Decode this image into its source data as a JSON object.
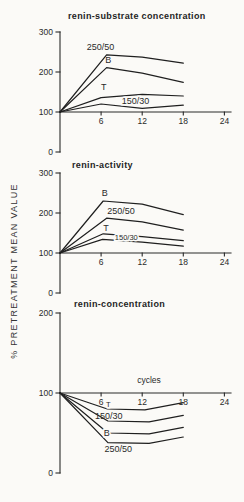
{
  "figure": {
    "ylabel": "% PRETREATMENT MEAN VALUE",
    "background": "#fbfaf7",
    "ink": "#1f1f1f"
  },
  "chart_data": [
    {
      "type": "line",
      "title": "renin-substrate concentration",
      "xlabel": "",
      "xlabel_pos": null,
      "xlim": [
        0,
        25
      ],
      "ylim": [
        0,
        300
      ],
      "xticks": [
        6,
        12,
        18,
        24
      ],
      "yticks": [
        0,
        100,
        200,
        300
      ],
      "baseline": 100,
      "legend_position": "inline-labels",
      "grid": false,
      "series": [
        {
          "name": "250/50",
          "points": [
            [
              0,
              100
            ],
            [
              6.8,
              243
            ],
            [
              12,
              237
            ],
            [
              18,
              222
            ]
          ],
          "label": {
            "text": "250/50",
            "x": 3.9,
            "y": 255,
            "small": false,
            "halo": false
          }
        },
        {
          "name": "B",
          "points": [
            [
              0,
              100
            ],
            [
              6.8,
              211
            ],
            [
              12,
              197
            ],
            [
              18,
              174
            ]
          ],
          "label": {
            "text": "B",
            "x": 6.6,
            "y": 222,
            "small": false,
            "halo": false
          }
        },
        {
          "name": "T",
          "points": [
            [
              0,
              100
            ],
            [
              6,
              136
            ],
            [
              12,
              144
            ],
            [
              18,
              140
            ]
          ],
          "label": {
            "text": "T",
            "x": 6.0,
            "y": 155,
            "small": false,
            "halo": false
          }
        },
        {
          "name": "150/30",
          "points": [
            [
              0,
              100
            ],
            [
              6,
              120
            ],
            [
              12,
              109
            ],
            [
              18,
              117
            ]
          ],
          "label": {
            "text": "150/30",
            "x": 9.0,
            "y": 120,
            "small": false,
            "halo": true
          }
        }
      ]
    },
    {
      "type": "line",
      "title": "renin-activity",
      "xlabel": "",
      "xlabel_pos": null,
      "xlim": [
        0,
        25
      ],
      "ylim": [
        0,
        300
      ],
      "xticks": [
        6,
        12,
        18,
        24
      ],
      "yticks": [
        0,
        100,
        200,
        300
      ],
      "baseline": 100,
      "legend_position": "inline-labels",
      "grid": false,
      "series": [
        {
          "name": "B",
          "points": [
            [
              0,
              100
            ],
            [
              6.3,
              230
            ],
            [
              12,
              222
            ],
            [
              18,
              196
            ]
          ],
          "label": {
            "text": "B",
            "x": 6.1,
            "y": 242,
            "small": false,
            "halo": false
          }
        },
        {
          "name": "250/50",
          "points": [
            [
              0,
              100
            ],
            [
              6.8,
              187
            ],
            [
              12,
              178
            ],
            [
              18,
              157
            ]
          ],
          "label": {
            "text": "250/50",
            "x": 6.9,
            "y": 197,
            "small": false,
            "halo": false
          }
        },
        {
          "name": "T",
          "points": [
            [
              0,
              100
            ],
            [
              6.3,
              148
            ],
            [
              12,
              141
            ],
            [
              18,
              131
            ]
          ],
          "label": {
            "text": "T",
            "x": 6.3,
            "y": 155,
            "small": false,
            "halo": false
          }
        },
        {
          "name": "150/30",
          "points": [
            [
              0,
              100
            ],
            [
              6.2,
              134
            ],
            [
              12,
              127
            ],
            [
              18,
              117
            ]
          ],
          "label": {
            "text": "150/30",
            "x": 8.0,
            "y": 132,
            "small": true,
            "halo": true
          }
        }
      ]
    },
    {
      "type": "line",
      "title": "renin-concentration",
      "xlabel": "cycles",
      "xlabel_pos": {
        "x": 13,
        "y": 112
      },
      "xlim": [
        0,
        25
      ],
      "ylim": [
        0,
        200
      ],
      "xticks": [
        6,
        12,
        18,
        24
      ],
      "yticks": [
        0,
        100,
        200
      ],
      "baseline": 100,
      "legend_position": "inline-labels",
      "grid": false,
      "series": [
        {
          "name": "T",
          "points": [
            [
              0,
              100
            ],
            [
              6.9,
              80
            ],
            [
              12.4,
              79
            ],
            [
              18,
              88
            ]
          ],
          "label": {
            "text": "T",
            "x": 6.7,
            "y": 83,
            "small": true,
            "halo": true
          }
        },
        {
          "name": "150/30",
          "points": [
            [
              0,
              100
            ],
            [
              7,
              65
            ],
            [
              13,
              64
            ],
            [
              18,
              72
            ]
          ],
          "label": {
            "text": "150/30",
            "x": 5.1,
            "y": 68,
            "small": false,
            "halo": false
          }
        },
        {
          "name": "B",
          "points": [
            [
              0,
              100
            ],
            [
              7,
              50
            ],
            [
              13,
              49
            ],
            [
              18,
              57
            ]
          ],
          "label": {
            "text": "B",
            "x": 6.4,
            "y": 46,
            "small": false,
            "halo": true
          }
        },
        {
          "name": "250/50",
          "points": [
            [
              0,
              100
            ],
            [
              7,
              38
            ],
            [
              13,
              37
            ],
            [
              18,
              45
            ]
          ],
          "label": {
            "text": "250/50",
            "x": 6.5,
            "y": 26,
            "small": false,
            "halo": false
          }
        }
      ]
    }
  ]
}
